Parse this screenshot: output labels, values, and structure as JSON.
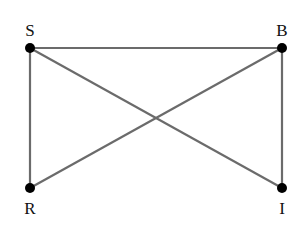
{
  "diagram": {
    "type": "graph",
    "nodes": [
      {
        "id": "S",
        "label": "S",
        "x": 30,
        "y": 48
      },
      {
        "id": "B",
        "label": "B",
        "x": 282,
        "y": 48
      },
      {
        "id": "R",
        "label": "R",
        "x": 30,
        "y": 188
      },
      {
        "id": "I",
        "label": "I",
        "x": 282,
        "y": 188
      }
    ],
    "edges": [
      [
        "S",
        "B"
      ],
      [
        "S",
        "R"
      ],
      [
        "S",
        "I"
      ],
      [
        "B",
        "R"
      ],
      [
        "B",
        "I"
      ]
    ],
    "colors": {
      "edge": "#6b6b6b",
      "node": "#000000",
      "label": "#111111"
    }
  }
}
